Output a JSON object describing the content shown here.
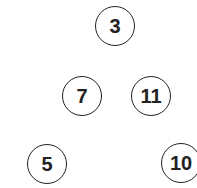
{
  "nodes": [
    {
      "label": "3",
      "x": 115,
      "y": 26
    },
    {
      "label": "7",
      "x": 82,
      "y": 96
    },
    {
      "label": "11",
      "x": 151,
      "y": 96
    },
    {
      "label": "5",
      "x": 47,
      "y": 164
    },
    {
      "label": "10",
      "x": 181,
      "y": 163
    }
  ],
  "colors": {
    "stroke": "#222222",
    "background": "#ffffff"
  }
}
